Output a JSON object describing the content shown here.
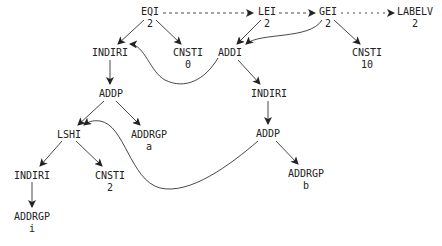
{
  "diagram": {
    "type": "dag",
    "nodes": [
      {
        "id": "eqi",
        "op": "EQI",
        "sub": "2",
        "x": 150,
        "y": 6
      },
      {
        "id": "lei",
        "op": "LEI",
        "sub": "2",
        "x": 267,
        "y": 6
      },
      {
        "id": "gei",
        "op": "GEI",
        "sub": "2",
        "x": 328,
        "y": 6
      },
      {
        "id": "labelv",
        "op": "LABELV",
        "sub": "2",
        "x": 415,
        "y": 6
      },
      {
        "id": "indiri1",
        "op": "INDIRI",
        "sub": "",
        "x": 110,
        "y": 47
      },
      {
        "id": "cnsti0",
        "op": "CNSTI",
        "sub": "0",
        "x": 188,
        "y": 47
      },
      {
        "id": "addi",
        "op": "ADDI",
        "sub": "",
        "x": 230,
        "y": 47
      },
      {
        "id": "cnsti10",
        "op": "CNSTI",
        "sub": "10",
        "x": 367,
        "y": 47
      },
      {
        "id": "addp1",
        "op": "ADDP",
        "sub": "",
        "x": 111,
        "y": 88
      },
      {
        "id": "indiri2",
        "op": "INDIRI",
        "sub": "",
        "x": 269,
        "y": 88
      },
      {
        "id": "lshi",
        "op": "LSHI",
        "sub": "",
        "x": 69,
        "y": 129
      },
      {
        "id": "addrgp_a",
        "op": "ADDRGP",
        "sub": "a",
        "x": 149,
        "y": 129
      },
      {
        "id": "addp2",
        "op": "ADDP",
        "sub": "",
        "x": 268,
        "y": 128
      },
      {
        "id": "indiri3",
        "op": "INDIRI",
        "sub": "",
        "x": 32,
        "y": 170
      },
      {
        "id": "cnsti2",
        "op": "CNSTI",
        "sub": "2",
        "x": 110,
        "y": 170
      },
      {
        "id": "addrgp_b",
        "op": "ADDRGP",
        "sub": "b",
        "x": 306,
        "y": 168
      },
      {
        "id": "addrgp_i",
        "op": "ADDRGP",
        "sub": "i",
        "x": 32,
        "y": 211
      }
    ],
    "edges": [
      {
        "from": "EQI",
        "to": "INDIRI",
        "style": "solid"
      },
      {
        "from": "EQI",
        "to": "CNSTI 0",
        "style": "solid"
      },
      {
        "from": "EQI",
        "to": "LEI",
        "style": "dashed"
      },
      {
        "from": "LEI",
        "to": "GEI",
        "style": "dashed"
      },
      {
        "from": "GEI",
        "to": "LABELV",
        "style": "dashed"
      },
      {
        "from": "LEI",
        "to": "ADDI",
        "style": "solid"
      },
      {
        "from": "LEI",
        "to": "INDIRI (left)",
        "style": "solid-curve"
      },
      {
        "from": "GEI",
        "to": "ADDI",
        "style": "solid-curve"
      },
      {
        "from": "GEI",
        "to": "CNSTI 10",
        "style": "solid"
      },
      {
        "from": "INDIRI",
        "to": "ADDP",
        "style": "solid"
      },
      {
        "from": "ADDI",
        "to": "INDIRI (right)",
        "style": "solid"
      },
      {
        "from": "ADDP",
        "to": "LSHI",
        "style": "solid"
      },
      {
        "from": "ADDP",
        "to": "ADDRGP a",
        "style": "solid"
      },
      {
        "from": "INDIRI (right)",
        "to": "ADDP (right)",
        "style": "solid"
      },
      {
        "from": "ADDP (right)",
        "to": "LSHI",
        "style": "solid-curve"
      },
      {
        "from": "ADDP (right)",
        "to": "ADDRGP b",
        "style": "solid"
      },
      {
        "from": "LSHI",
        "to": "INDIRI (bottom)",
        "style": "solid"
      },
      {
        "from": "LSHI",
        "to": "CNSTI 2",
        "style": "solid"
      },
      {
        "from": "INDIRI (bottom)",
        "to": "ADDRGP i",
        "style": "solid"
      }
    ]
  }
}
